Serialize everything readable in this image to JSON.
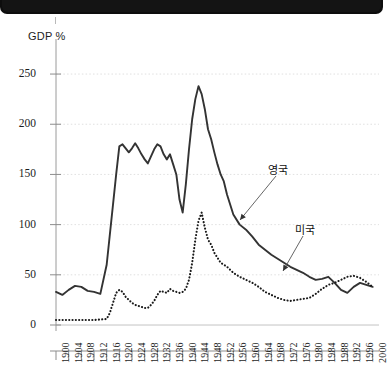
{
  "topbar": {
    "name": "black-title-bar"
  },
  "chart_data": {
    "type": "line",
    "title": "",
    "subtitle": "",
    "ylabel": "GDP %",
    "xlabel": "",
    "ylim": [
      0,
      265
    ],
    "xlim": [
      1900,
      2002
    ],
    "yticks": [
      0,
      50,
      100,
      150,
      200,
      250
    ],
    "ytick_labels": [
      "0",
      "50",
      "100",
      "150",
      "200",
      "250"
    ],
    "xticks": [
      1900,
      1904,
      1908,
      1912,
      1916,
      1920,
      1924,
      1928,
      1932,
      1936,
      1940,
      1944,
      1948,
      1952,
      1956,
      1960,
      1964,
      1968,
      1972,
      1976,
      1980,
      1984,
      1988,
      1992,
      1996,
      2000
    ],
    "xtick_labels": [
      "1900",
      "1904",
      "1908",
      "1912",
      "1916",
      "1920",
      "1924",
      "1928",
      "1932",
      "1936",
      "1940",
      "1944",
      "1948",
      "1952",
      "1956",
      "1960",
      "1964",
      "1968",
      "1972",
      "1976",
      "1980",
      "1984",
      "1988",
      "1992",
      "1996",
      "2000"
    ],
    "grid": true,
    "grid_axis": "y",
    "legend_position": "annotation",
    "series": [
      {
        "name": "영국",
        "label": "영국",
        "style": "solid",
        "color": "#333333",
        "x": [
          1900,
          1902,
          1904,
          1906,
          1908,
          1910,
          1912,
          1914,
          1916,
          1918,
          1919,
          1920,
          1921,
          1922,
          1923,
          1924,
          1925,
          1926,
          1927,
          1928,
          1929,
          1930,
          1931,
          1932,
          1933,
          1934,
          1935,
          1936,
          1937,
          1938,
          1939,
          1940,
          1941,
          1942,
          1943,
          1944,
          1945,
          1946,
          1947,
          1948,
          1949,
          1950,
          1951,
          1952,
          1953,
          1954,
          1955,
          1956,
          1958,
          1960,
          1962,
          1964,
          1966,
          1968,
          1970,
          1972,
          1974,
          1976,
          1978,
          1980,
          1982,
          1984,
          1986,
          1988,
          1990,
          1992,
          1994,
          1996,
          1998,
          2000
        ],
        "y": [
          33,
          30,
          35,
          39,
          38,
          34,
          33,
          31,
          60,
          120,
          150,
          178,
          180,
          176,
          172,
          176,
          181,
          176,
          170,
          165,
          161,
          168,
          175,
          180,
          178,
          170,
          165,
          170,
          160,
          150,
          125,
          112,
          140,
          175,
          205,
          225,
          238,
          230,
          215,
          195,
          185,
          172,
          160,
          150,
          143,
          130,
          120,
          110,
          100,
          95,
          88,
          80,
          75,
          70,
          66,
          62,
          58,
          55,
          52,
          48,
          45,
          46,
          48,
          42,
          35,
          32,
          38,
          42,
          40,
          38
        ],
        "annotation": {
          "text": "영국",
          "x": 1968,
          "y": 155,
          "arrow_to_x": 1956,
          "arrow_to_y": 102
        }
      },
      {
        "name": "미국",
        "label": "미국",
        "style": "dotted",
        "color": "#1a1a1a",
        "x": [
          1900,
          1904,
          1908,
          1912,
          1916,
          1917,
          1918,
          1919,
          1920,
          1921,
          1922,
          1923,
          1924,
          1925,
          1926,
          1927,
          1928,
          1929,
          1930,
          1931,
          1932,
          1933,
          1934,
          1935,
          1936,
          1937,
          1938,
          1939,
          1940,
          1941,
          1942,
          1943,
          1944,
          1945,
          1946,
          1947,
          1948,
          1949,
          1950,
          1952,
          1954,
          1956,
          1958,
          1960,
          1962,
          1964,
          1966,
          1968,
          1970,
          1972,
          1974,
          1976,
          1978,
          1980,
          1982,
          1984,
          1986,
          1988,
          1990,
          1992,
          1994,
          1996,
          1998,
          2000
        ],
        "y": [
          5,
          5,
          5,
          5,
          6,
          12,
          22,
          32,
          35,
          33,
          28,
          25,
          22,
          20,
          19,
          18,
          17,
          17,
          20,
          24,
          30,
          34,
          33,
          32,
          36,
          34,
          33,
          32,
          33,
          36,
          45,
          62,
          85,
          104,
          112,
          97,
          85,
          80,
          72,
          62,
          58,
          52,
          48,
          45,
          42,
          38,
          33,
          30,
          27,
          25,
          24,
          25,
          26,
          27,
          31,
          36,
          40,
          42,
          45,
          48,
          49,
          47,
          43,
          38
        ]
      }
    ],
    "annotations": [
      {
        "name": "uk-annotation",
        "text": "영국"
      },
      {
        "name": "us-annotation",
        "text": "미국"
      }
    ]
  }
}
